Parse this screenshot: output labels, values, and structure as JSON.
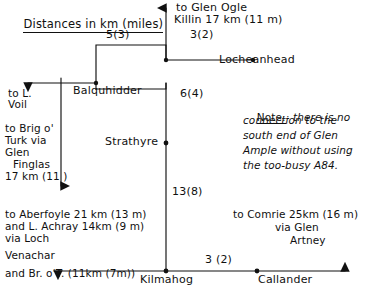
{
  "diagram": {
    "title": "Distances in km (miles)",
    "type": "road-distance-network",
    "units": "km (miles)",
    "nodes": [
      {
        "id": "balquhidder-junction",
        "label": "",
        "x": 96,
        "y": 83
      },
      {
        "id": "balquhidder",
        "label": "Balquhidder",
        "x": 75,
        "y": 92
      },
      {
        "id": "lochearnhead-junction",
        "label": "",
        "x": 166,
        "y": 60
      },
      {
        "id": "lochearnhead",
        "label": "Locheanhead",
        "x": 222,
        "y": 62
      },
      {
        "id": "strathyre",
        "label": "Strathyre",
        "x": 165,
        "y": 143
      },
      {
        "id": "kilmahog",
        "label": "Kilmahog",
        "x": 165,
        "y": 271
      },
      {
        "id": "callander",
        "label": "Callander",
        "x": 266,
        "y": 271
      }
    ],
    "edge_labels": [
      {
        "id": "balquhidder-lochearnhead",
        "text": "5(3)",
        "km": 5,
        "miles": 3
      },
      {
        "id": "lochearnhead-locheanhead",
        "text": "3(2)",
        "km": 3,
        "miles": 2
      },
      {
        "id": "balquhidder-strathyre",
        "text": "6(4)",
        "km": 6,
        "miles": 4
      },
      {
        "id": "strathyre-kilmahog",
        "text": "13(8)",
        "km": 13,
        "miles": 8
      },
      {
        "id": "kilmahog-callander",
        "text": "3 (2)",
        "km": 3,
        "miles": 2
      }
    ],
    "destinations": {
      "glen_ogle": {
        "line1": "to Glen Ogle",
        "line2": "Killin 17 km (11 m)"
      },
      "loch_voil": {
        "line1": "to L.",
        "line2": "Voil"
      },
      "brig_o_turk": {
        "line1": "to Brig o'",
        "line2": "Turk via",
        "line3": "Glen",
        "line4": "Finglas",
        "line5": "17 km (11 )"
      },
      "aberfoyle": {
        "line1": "to Aberfoyle 21 km (13 m)",
        "line2": "and L. Achray 14km (9 m)",
        "line3": "via Loch",
        "line4": "Venachar",
        "line5": "and Br. o'T. (11km (7m))"
      },
      "comrie": {
        "line1": "to Comrie 25km (16 m)",
        "line2": "via Glen",
        "line3": "Artney"
      }
    },
    "note": {
      "heading": "Note:",
      "line1": "- there is no",
      "line2": "connection to the",
      "line3": "south end of Glen",
      "line4": "Ample without using",
      "line5": "the too-busy A84."
    },
    "colors": {
      "ink": "#111111",
      "paper": "#ffffff"
    }
  }
}
